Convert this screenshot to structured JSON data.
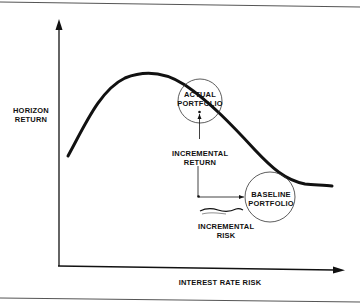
{
  "diagram": {
    "axes": {
      "y_label": [
        "HORIZON",
        "RETURN"
      ],
      "x_label": "INTEREST RATE RISK"
    },
    "nodes": {
      "actual_portfolio": [
        "ACTUAL",
        "PORTFOLIO"
      ],
      "baseline_portfolio": [
        "BASELINE",
        "PORTFOLIO"
      ]
    },
    "annotations": {
      "incremental_return": [
        "INCREMENTAL",
        "RETURN"
      ],
      "incremental_risk": [
        "INCREMENTAL",
        "RISK"
      ]
    },
    "colors": {
      "ink": "#111111",
      "background": "#ffffff",
      "border": "#555555"
    }
  }
}
